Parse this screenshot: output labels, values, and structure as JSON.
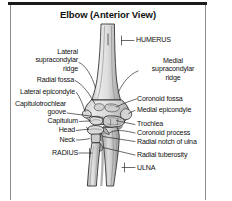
{
  "figure": {
    "title": "Elbow (Anterior View)",
    "view": "anterior",
    "bones_depicted": [
      "humerus",
      "radius",
      "ulna"
    ],
    "style": "grayscale line-art anatomical illustration",
    "colors": {
      "background": "#ffffff",
      "frame_rule": "#1b1b1b",
      "frame_line": "#8d8d8d",
      "text": "#111111",
      "bone_outline": "#2a2a2a",
      "bone_fill_light": "#e6e6e6",
      "bone_fill_mid": "#cfcfcf",
      "bone_fill_shadow": "#9a9a9a",
      "leader_line": "#1a1a1a"
    }
  },
  "labels": {
    "left": [
      {
        "id": "lateral-supracondylar-ridge",
        "text": "Lateral\nsupracondylar\nridge",
        "lines": [
          "Lateral",
          "supracondylar",
          "ridge"
        ]
      },
      {
        "id": "radial-fossa",
        "text": "Radial fossa",
        "lines": [
          "Radial fossa"
        ]
      },
      {
        "id": "lateral-epicondyle",
        "text": "Lateral epicondyle",
        "lines": [
          "Lateral epicondyle"
        ]
      },
      {
        "id": "capitulotrochlear-groove",
        "text": "Capitulotrochlear\ngoove",
        "lines": [
          "Capitulotrochlear",
          "goove"
        ]
      },
      {
        "id": "capitulum",
        "text": "Capitulum",
        "lines": [
          "Capitulum"
        ]
      },
      {
        "id": "head",
        "text": "Head",
        "lines": [
          "Head"
        ]
      },
      {
        "id": "neck",
        "text": "Neck",
        "lines": [
          "Neck"
        ]
      },
      {
        "id": "radius",
        "text": "RADIUS",
        "lines": [
          "RADIUS"
        ]
      }
    ],
    "right": [
      {
        "id": "humerus",
        "text": "HUMERUS",
        "lines": [
          "HUMERUS"
        ]
      },
      {
        "id": "medial-supracondylar-ridge",
        "text": "Medial\nsupracondylar\nridge",
        "lines": [
          "Medial",
          "supracondylar",
          "ridge"
        ]
      },
      {
        "id": "coronoid-fossa",
        "text": "Coronoid fossa",
        "lines": [
          "Coronoid fossa"
        ]
      },
      {
        "id": "medial-epicondyle",
        "text": "Medial epicondyle",
        "lines": [
          "Medial epicondyle"
        ]
      },
      {
        "id": "trochlea",
        "text": "Trochlea",
        "lines": [
          "Trochlea"
        ]
      },
      {
        "id": "coronoid-process",
        "text": "Coronoid process",
        "lines": [
          "Coronoid process"
        ]
      },
      {
        "id": "radial-notch-of-ulna",
        "text": "Radial notch of ulna",
        "lines": [
          "Radial notch of ulna"
        ]
      },
      {
        "id": "radial-tuberosity",
        "text": "Radial tuberosity",
        "lines": [
          "Radial tuberosity"
        ]
      },
      {
        "id": "ulna",
        "text": "ULNA",
        "lines": [
          "ULNA"
        ]
      }
    ]
  },
  "label_text": {
    "lateral_supracondylar_ridge_l1": "Lateral",
    "lateral_supracondylar_ridge_l2": "supracondylar",
    "lateral_supracondylar_ridge_l3": "ridge",
    "radial_fossa": "Radial fossa",
    "lateral_epicondyle": "Lateral epicondyle",
    "capitulotrochlear_l1": "Capitulotrochlear",
    "capitulotrochlear_l2": "goove",
    "capitulum": "Capitulum",
    "head": "Head",
    "neck": "Neck",
    "radius": "RADIUS",
    "humerus": "HUMERUS",
    "medial_supracondylar_ridge_l1": "Medial",
    "medial_supracondylar_ridge_l2": "supracondylar",
    "medial_supracondylar_ridge_l3": "ridge",
    "coronoid_fossa": "Coronoid fossa",
    "medial_epicondyle": "Medial epicondyle",
    "trochlea": "Trochlea",
    "coronoid_process": "Coronoid process",
    "radial_notch_of_ulna": "Radial notch of ulna",
    "radial_tuberosity": "Radial tuberosity",
    "ulna": "ULNA"
  }
}
